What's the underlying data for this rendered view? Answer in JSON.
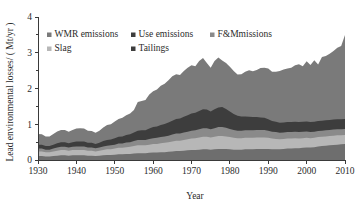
{
  "chart_data": {
    "type": "area",
    "stacked": true,
    "title": "",
    "xlabel": "Year",
    "ylabel": "Lead environmental losses/ ( Mt/yr )",
    "xlim": [
      1930,
      2010
    ],
    "ylim": [
      0,
      4
    ],
    "xticks": [
      1930,
      1940,
      1950,
      1960,
      1970,
      1980,
      1990,
      2000,
      2010
    ],
    "yticks": [
      0,
      1,
      2,
      3,
      4
    ],
    "yminorticks": [
      0.5,
      1.5,
      2.5,
      3.5
    ],
    "grid": false,
    "legend_position": "upper-left-inside",
    "x": [
      1930,
      1931,
      1932,
      1933,
      1934,
      1935,
      1936,
      1937,
      1938,
      1939,
      1940,
      1941,
      1942,
      1943,
      1944,
      1945,
      1946,
      1947,
      1948,
      1949,
      1950,
      1951,
      1952,
      1953,
      1954,
      1955,
      1956,
      1957,
      1958,
      1959,
      1960,
      1961,
      1962,
      1963,
      1964,
      1965,
      1966,
      1967,
      1968,
      1969,
      1970,
      1971,
      1972,
      1973,
      1974,
      1975,
      1976,
      1977,
      1978,
      1979,
      1980,
      1981,
      1982,
      1983,
      1984,
      1985,
      1986,
      1987,
      1988,
      1989,
      1990,
      1991,
      1992,
      1993,
      1994,
      1995,
      1996,
      1997,
      1998,
      1999,
      2000,
      2001,
      2002,
      2003,
      2004,
      2005,
      2006,
      2007,
      2008,
      2009,
      2010
    ],
    "series": [
      {
        "name": "Tailings",
        "color": "#6e6e6e",
        "stack_order": 1,
        "values": [
          0.11,
          0.11,
          0.1,
          0.1,
          0.11,
          0.12,
          0.13,
          0.13,
          0.12,
          0.13,
          0.13,
          0.13,
          0.13,
          0.12,
          0.12,
          0.11,
          0.12,
          0.13,
          0.14,
          0.14,
          0.15,
          0.16,
          0.16,
          0.17,
          0.17,
          0.18,
          0.19,
          0.19,
          0.19,
          0.2,
          0.21,
          0.21,
          0.22,
          0.22,
          0.23,
          0.24,
          0.25,
          0.25,
          0.26,
          0.27,
          0.28,
          0.28,
          0.29,
          0.3,
          0.3,
          0.29,
          0.3,
          0.31,
          0.31,
          0.31,
          0.3,
          0.29,
          0.29,
          0.29,
          0.3,
          0.3,
          0.3,
          0.31,
          0.31,
          0.31,
          0.31,
          0.3,
          0.3,
          0.3,
          0.31,
          0.32,
          0.32,
          0.33,
          0.33,
          0.34,
          0.35,
          0.35,
          0.36,
          0.38,
          0.39,
          0.4,
          0.41,
          0.42,
          0.43,
          0.44,
          0.45
        ]
      },
      {
        "name": "Slag",
        "color": "#b7b7b7",
        "stack_order": 2,
        "values": [
          0.13,
          0.13,
          0.12,
          0.12,
          0.13,
          0.14,
          0.15,
          0.15,
          0.14,
          0.15,
          0.15,
          0.15,
          0.15,
          0.14,
          0.14,
          0.13,
          0.14,
          0.15,
          0.16,
          0.16,
          0.17,
          0.18,
          0.18,
          0.19,
          0.2,
          0.21,
          0.22,
          0.22,
          0.22,
          0.23,
          0.24,
          0.24,
          0.25,
          0.26,
          0.27,
          0.28,
          0.29,
          0.29,
          0.3,
          0.31,
          0.32,
          0.33,
          0.34,
          0.35,
          0.35,
          0.34,
          0.35,
          0.36,
          0.36,
          0.35,
          0.34,
          0.33,
          0.32,
          0.32,
          0.32,
          0.32,
          0.32,
          0.32,
          0.32,
          0.32,
          0.31,
          0.3,
          0.29,
          0.28,
          0.28,
          0.28,
          0.28,
          0.28,
          0.27,
          0.27,
          0.27,
          0.26,
          0.26,
          0.26,
          0.26,
          0.26,
          0.26,
          0.26,
          0.26,
          0.25,
          0.25
        ]
      },
      {
        "name": "F&Mmissions",
        "color": "#8a8a8a",
        "stack_order": 3,
        "values": [
          0.08,
          0.08,
          0.07,
          0.07,
          0.08,
          0.09,
          0.09,
          0.09,
          0.09,
          0.09,
          0.1,
          0.1,
          0.1,
          0.09,
          0.09,
          0.09,
          0.09,
          0.1,
          0.1,
          0.11,
          0.11,
          0.12,
          0.12,
          0.13,
          0.13,
          0.14,
          0.15,
          0.15,
          0.15,
          0.16,
          0.16,
          0.17,
          0.17,
          0.18,
          0.18,
          0.19,
          0.2,
          0.2,
          0.21,
          0.21,
          0.22,
          0.22,
          0.23,
          0.24,
          0.24,
          0.23,
          0.24,
          0.25,
          0.25,
          0.24,
          0.23,
          0.22,
          0.21,
          0.21,
          0.21,
          0.21,
          0.21,
          0.21,
          0.21,
          0.21,
          0.2,
          0.19,
          0.19,
          0.18,
          0.18,
          0.18,
          0.18,
          0.18,
          0.18,
          0.18,
          0.18,
          0.17,
          0.17,
          0.17,
          0.17,
          0.17,
          0.17,
          0.17,
          0.17,
          0.17,
          0.17
        ]
      },
      {
        "name": "Use emissions",
        "color": "#3d3d3d",
        "stack_order": 4,
        "values": [
          0.11,
          0.11,
          0.1,
          0.1,
          0.11,
          0.12,
          0.13,
          0.13,
          0.12,
          0.13,
          0.14,
          0.14,
          0.14,
          0.13,
          0.13,
          0.12,
          0.13,
          0.15,
          0.16,
          0.16,
          0.18,
          0.19,
          0.2,
          0.21,
          0.22,
          0.24,
          0.26,
          0.27,
          0.27,
          0.29,
          0.31,
          0.32,
          0.34,
          0.35,
          0.37,
          0.39,
          0.41,
          0.42,
          0.44,
          0.46,
          0.48,
          0.49,
          0.51,
          0.53,
          0.52,
          0.5,
          0.53,
          0.55,
          0.56,
          0.53,
          0.49,
          0.45,
          0.42,
          0.4,
          0.39,
          0.38,
          0.37,
          0.36,
          0.35,
          0.34,
          0.32,
          0.3,
          0.29,
          0.28,
          0.28,
          0.28,
          0.28,
          0.28,
          0.28,
          0.28,
          0.28,
          0.28,
          0.28,
          0.28,
          0.28,
          0.28,
          0.28,
          0.28,
          0.28,
          0.28,
          0.28
        ]
      },
      {
        "name": "WMR emissions",
        "color": "#7a7a7a",
        "stack_order": 5,
        "values": [
          0.3,
          0.29,
          0.27,
          0.27,
          0.3,
          0.33,
          0.34,
          0.34,
          0.32,
          0.34,
          0.36,
          0.37,
          0.36,
          0.34,
          0.33,
          0.31,
          0.34,
          0.38,
          0.42,
          0.43,
          0.47,
          0.5,
          0.52,
          0.55,
          0.58,
          0.63,
          0.8,
          0.82,
          0.85,
          0.95,
          1.0,
          1.03,
          1.1,
          1.12,
          1.18,
          1.24,
          1.25,
          1.22,
          1.28,
          1.33,
          1.35,
          1.3,
          1.4,
          1.43,
          1.3,
          1.22,
          1.35,
          1.4,
          1.3,
          1.28,
          1.25,
          1.2,
          1.15,
          1.18,
          1.25,
          1.3,
          1.28,
          1.32,
          1.38,
          1.4,
          1.42,
          1.38,
          1.4,
          1.45,
          1.48,
          1.5,
          1.52,
          1.58,
          1.62,
          1.55,
          1.68,
          1.6,
          1.72,
          1.58,
          1.78,
          1.8,
          1.85,
          1.92,
          2.0,
          2.05,
          2.35
        ]
      }
    ],
    "legend": [
      {
        "label": "WMR emissions",
        "color": "#7a7a7a"
      },
      {
        "label": "Use emissions",
        "color": "#3d3d3d"
      },
      {
        "label": "F&Mmissions",
        "color": "#8a8a8a"
      },
      {
        "label": "Slag",
        "color": "#b7b7b7"
      },
      {
        "label": "Tailings",
        "color": "#3d3d3d"
      }
    ]
  }
}
